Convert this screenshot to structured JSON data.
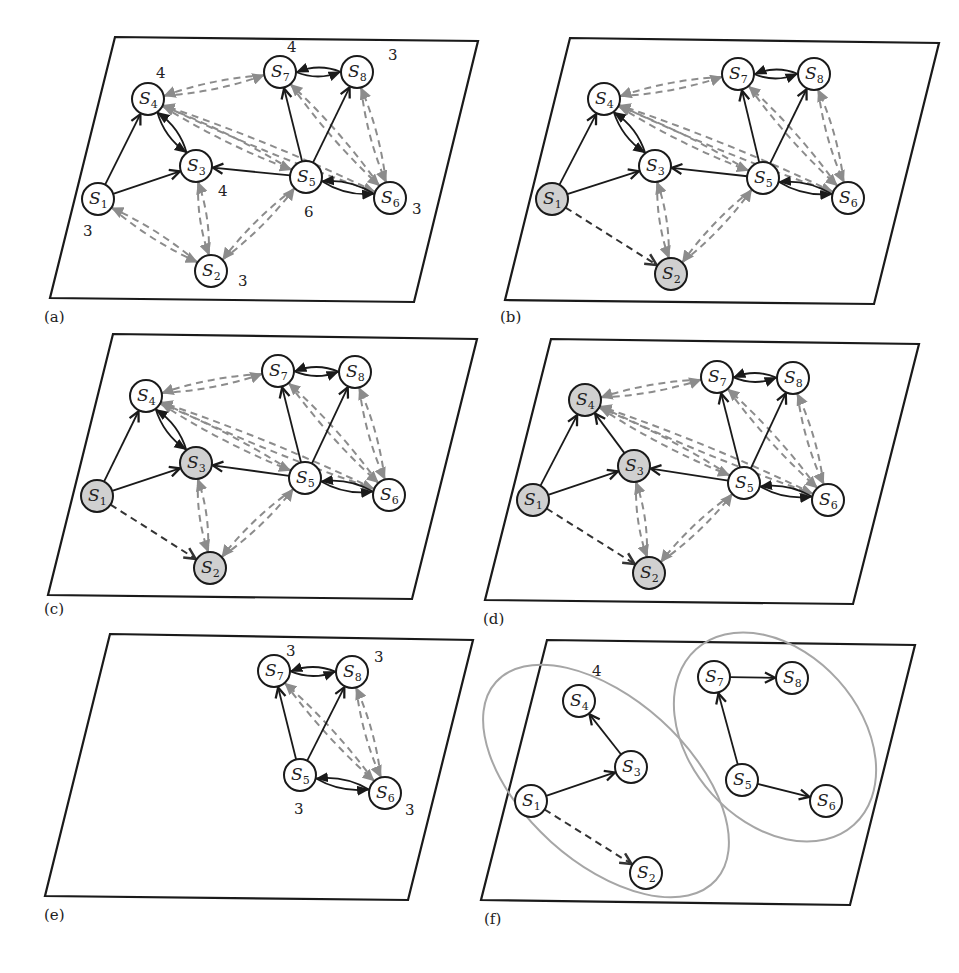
{
  "colors": {
    "frame": "#1a1a1a",
    "node_fill": "#ffffff",
    "node_shaded": "#d0d0d0",
    "gray_edge": "#8c8c8c",
    "ellipse": "#a6a6a6"
  },
  "panels": [
    {
      "id": "a",
      "label": "(a)",
      "label_pos": [
        44,
        308
      ],
      "frame": [
        [
          115,
          37
        ],
        [
          478,
          41
        ],
        [
          414,
          302
        ],
        [
          50,
          298
        ]
      ],
      "nodes": {
        "S1": [
          98,
          199
        ],
        "S2": [
          211,
          271
        ],
        "S3": [
          196,
          166
        ],
        "S4": [
          148,
          99
        ],
        "S5": [
          306,
          177
        ],
        "S6": [
          390,
          198
        ],
        "S7": [
          280,
          72
        ],
        "S8": [
          357,
          72
        ]
      },
      "shaded": [],
      "solid": [
        [
          "S1",
          "S4"
        ],
        [
          "S1",
          "S3"
        ],
        [
          "S5",
          "S3"
        ],
        [
          "S5",
          "S7"
        ],
        [
          "S5",
          "S8"
        ]
      ],
      "solid_pairs": [
        [
          "S4",
          "S3"
        ],
        [
          "S7",
          "S8"
        ],
        [
          "S5",
          "S6"
        ]
      ],
      "gray_pairs": [
        [
          "S7",
          "S4"
        ],
        [
          "S5",
          "S4"
        ],
        [
          "S6",
          "S4"
        ],
        [
          "S3",
          "S2"
        ],
        [
          "S1",
          "S2"
        ],
        [
          "S5",
          "S2"
        ],
        [
          "S7",
          "S6"
        ],
        [
          "S8",
          "S6"
        ],
        [
          "S5",
          "S7b"
        ]
      ],
      "dark_dash": [],
      "ellipses": [],
      "counts": [
        {
          "text": "4",
          "x": 156,
          "y": 78
        },
        {
          "text": "4",
          "x": 287,
          "y": 52
        },
        {
          "text": "3",
          "x": 388,
          "y": 60
        },
        {
          "text": "4",
          "x": 218,
          "y": 196
        },
        {
          "text": "6",
          "x": 304,
          "y": 217
        },
        {
          "text": "3",
          "x": 412,
          "y": 214
        },
        {
          "text": "3",
          "x": 83,
          "y": 236
        },
        {
          "text": "3",
          "x": 238,
          "y": 286
        }
      ]
    },
    {
      "id": "b",
      "label": "(b)",
      "label_pos": [
        500,
        308
      ],
      "frame": [
        [
          570,
          38
        ],
        [
          939,
          43
        ],
        [
          874,
          304
        ],
        [
          505,
          300
        ]
      ],
      "nodes": {
        "S1": [
          552,
          199
        ],
        "S2": [
          671,
          274
        ],
        "S3": [
          655,
          166
        ],
        "S4": [
          604,
          99
        ],
        "S5": [
          763,
          178
        ],
        "S6": [
          848,
          198
        ],
        "S7": [
          738,
          74
        ],
        "S8": [
          814,
          74
        ]
      },
      "shaded": [
        "S1",
        "S2"
      ],
      "solid": [
        [
          "S1",
          "S4"
        ],
        [
          "S1",
          "S3"
        ],
        [
          "S5",
          "S3"
        ],
        [
          "S5",
          "S7"
        ],
        [
          "S5",
          "S8"
        ]
      ],
      "solid_pairs": [
        [
          "S4",
          "S3"
        ],
        [
          "S8",
          "S7"
        ],
        [
          "S5",
          "S6"
        ]
      ],
      "gray_pairs": [
        [
          "S7",
          "S4"
        ],
        [
          "S5",
          "S4"
        ],
        [
          "S6",
          "S4"
        ],
        [
          "S3",
          "S2"
        ],
        [
          "S5",
          "S2"
        ],
        [
          "S7",
          "S6"
        ],
        [
          "S8",
          "S6"
        ]
      ],
      "dark_dash": [
        [
          "S1",
          "S2"
        ]
      ],
      "ellipses": [],
      "counts": []
    },
    {
      "id": "c",
      "label": "(c)",
      "label_pos": [
        44,
        600
      ],
      "frame": [
        [
          113,
          334
        ],
        [
          477,
          339
        ],
        [
          412,
          599
        ],
        [
          48,
          595
        ]
      ],
      "nodes": {
        "S1": [
          97,
          496
        ],
        "S2": [
          210,
          568
        ],
        "S3": [
          196,
          463
        ],
        "S4": [
          146,
          396
        ],
        "S5": [
          305,
          478
        ],
        "S6": [
          389,
          495
        ],
        "S7": [
          278,
          371
        ],
        "S8": [
          355,
          372
        ]
      },
      "shaded": [
        "S1",
        "S2",
        "S3"
      ],
      "solid": [
        [
          "S1",
          "S4"
        ],
        [
          "S1",
          "S3"
        ],
        [
          "S5",
          "S3"
        ],
        [
          "S5",
          "S7"
        ],
        [
          "S5",
          "S8"
        ]
      ],
      "solid_pairs": [
        [
          "S4",
          "S3"
        ],
        [
          "S8",
          "S7"
        ],
        [
          "S5",
          "S6"
        ]
      ],
      "gray_pairs": [
        [
          "S7",
          "S4"
        ],
        [
          "S5",
          "S4"
        ],
        [
          "S6",
          "S4"
        ],
        [
          "S3",
          "S2"
        ],
        [
          "S5",
          "S2"
        ],
        [
          "S7",
          "S6"
        ],
        [
          "S8",
          "S6"
        ]
      ],
      "dark_dash": [
        [
          "S1",
          "S2"
        ]
      ],
      "ellipses": [],
      "counts": []
    },
    {
      "id": "d",
      "label": "(d)",
      "label_pos": [
        483,
        610
      ],
      "frame": [
        [
          551,
          339
        ],
        [
          919,
          344
        ],
        [
          853,
          604
        ],
        [
          485,
          600
        ]
      ],
      "nodes": {
        "S1": [
          533,
          500
        ],
        "S2": [
          649,
          573
        ],
        "S3": [
          634,
          466
        ],
        "S4": [
          585,
          400
        ],
        "S5": [
          744,
          483
        ],
        "S6": [
          828,
          500
        ],
        "S7": [
          717,
          377
        ],
        "S8": [
          793,
          378
        ]
      },
      "shaded": [
        "S1",
        "S2",
        "S3",
        "S4"
      ],
      "solid": [
        [
          "S1",
          "S4"
        ],
        [
          "S1",
          "S3"
        ],
        [
          "S3",
          "S4"
        ],
        [
          "S5",
          "S3"
        ],
        [
          "S5",
          "S7"
        ],
        [
          "S5",
          "S8"
        ]
      ],
      "solid_pairs": [
        [
          "S8",
          "S7"
        ],
        [
          "S5",
          "S6"
        ]
      ],
      "gray_pairs": [
        [
          "S7",
          "S4"
        ],
        [
          "S5",
          "S4"
        ],
        [
          "S6",
          "S4"
        ],
        [
          "S3",
          "S2"
        ],
        [
          "S5",
          "S2"
        ],
        [
          "S7",
          "S6"
        ],
        [
          "S8",
          "S6"
        ]
      ],
      "dark_dash": [
        [
          "S1",
          "S2"
        ]
      ],
      "ellipses": [],
      "counts": []
    },
    {
      "id": "e",
      "label": "(e)",
      "label_pos": [
        44,
        906
      ],
      "frame": [
        [
          110,
          634
        ],
        [
          473,
          640
        ],
        [
          408,
          900
        ],
        [
          45,
          896
        ]
      ],
      "nodes": {
        "S5": [
          300,
          775
        ],
        "S6": [
          385,
          793
        ],
        "S7": [
          274,
          671
        ],
        "S8": [
          352,
          672
        ]
      },
      "shaded": [],
      "solid": [
        [
          "S5",
          "S7"
        ],
        [
          "S5",
          "S8"
        ]
      ],
      "solid_pairs": [
        [
          "S7",
          "S8"
        ],
        [
          "S5",
          "S6"
        ]
      ],
      "gray_pairs": [
        [
          "S7",
          "S6"
        ],
        [
          "S8",
          "S6"
        ]
      ],
      "dark_dash": [],
      "ellipses": [],
      "counts": [
        {
          "text": "3",
          "x": 286,
          "y": 656
        },
        {
          "text": "3",
          "x": 374,
          "y": 662
        },
        {
          "text": "3",
          "x": 294,
          "y": 814
        },
        {
          "text": "3",
          "x": 405,
          "y": 815
        }
      ]
    },
    {
      "id": "f",
      "label": "(f)",
      "label_pos": [
        484,
        910
      ],
      "frame": [
        [
          547,
          640
        ],
        [
          915,
          645
        ],
        [
          850,
          905
        ],
        [
          481,
          900
        ]
      ],
      "nodes": {
        "S1": [
          531,
          801
        ],
        "S2": [
          646,
          873
        ],
        "S3": [
          631,
          767
        ],
        "S4": [
          579,
          701
        ],
        "S5": [
          742,
          780
        ],
        "S6": [
          826,
          801
        ],
        "S7": [
          714,
          677
        ],
        "S8": [
          792,
          678
        ]
      },
      "shaded": [],
      "solid": [
        [
          "S1",
          "S3"
        ],
        [
          "S3",
          "S4"
        ],
        [
          "S5",
          "S7"
        ],
        [
          "S5",
          "S6"
        ],
        [
          "S7",
          "S8"
        ]
      ],
      "solid_pairs": [],
      "gray_pairs": [],
      "dark_dash": [
        [
          "S1",
          "S2"
        ]
      ],
      "ellipses": [
        {
          "cx": 606,
          "cy": 781,
          "rx": 148,
          "ry": 82,
          "rot": 42
        },
        {
          "cx": 775,
          "cy": 737,
          "rx": 118,
          "ry": 85,
          "rot": 48
        }
      ],
      "counts": [
        {
          "text": "4",
          "x": 592,
          "y": 676
        }
      ]
    }
  ]
}
